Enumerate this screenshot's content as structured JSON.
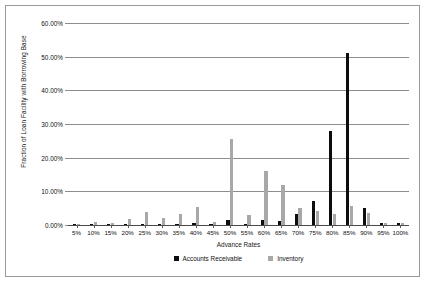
{
  "chart_data": {
    "type": "bar",
    "title": "",
    "xlabel": "Advance Rates",
    "ylabel": "Fraction of Loan Facility with Borrowing Base",
    "categories": [
      "5%",
      "10%",
      "15%",
      "20%",
      "25%",
      "30%",
      "35%",
      "40%",
      "45%",
      "50%",
      "55%",
      "60%",
      "65%",
      "70%",
      "75%",
      "80%",
      "85%",
      "90%",
      "95%",
      "100%"
    ],
    "ylim": [
      0,
      60
    ],
    "ytick_labels": [
      "60.00%",
      "50.00%",
      "40.00%",
      "30.00%",
      "20.00%",
      "10.00%",
      "0.00%"
    ],
    "ytick_values": [
      60,
      50,
      40,
      30,
      20,
      10,
      0
    ],
    "grid": true,
    "legend_position": "bottom",
    "series": [
      {
        "name": "Accounts Receivable",
        "color": "#0d0d0d",
        "values": [
          0.2,
          0.3,
          0.2,
          0.3,
          0.4,
          0.3,
          0.4,
          0.5,
          0.3,
          1.6,
          0.2,
          1.4,
          1.1,
          3.4,
          7.0,
          28.0,
          51.0,
          5.0,
          0.6,
          0.7
        ]
      },
      {
        "name": "Inventory",
        "color": "#a8a8a8",
        "values": [
          0.2,
          0.8,
          0.5,
          1.7,
          4.0,
          2.0,
          3.2,
          5.3,
          1.0,
          25.5,
          3.0,
          16.0,
          12.0,
          5.2,
          4.3,
          3.3,
          5.5,
          3.5,
          0.5,
          0.5
        ]
      }
    ]
  }
}
